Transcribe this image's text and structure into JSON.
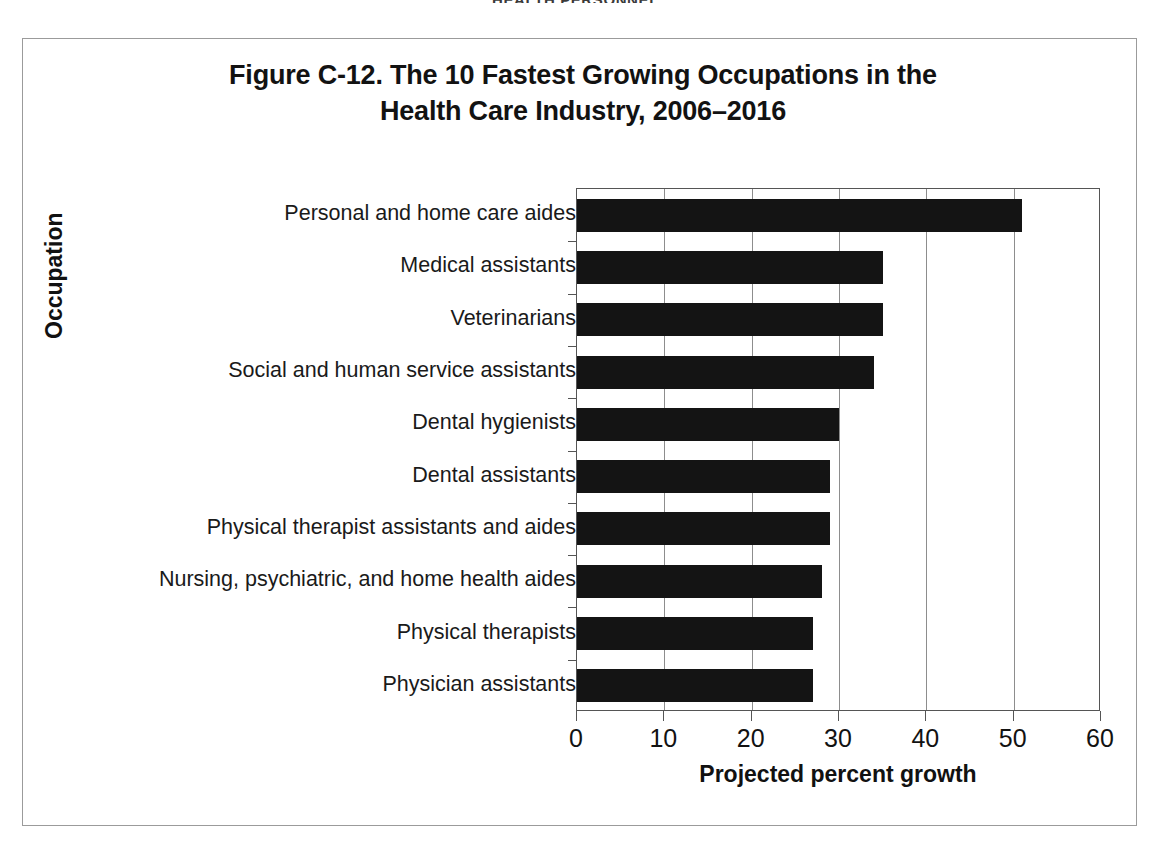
{
  "running_head": "HEALTH PERSONNEL",
  "figure": {
    "title_line1": "Figure C-12. The 10 Fastest Growing Occupations in the",
    "title_line2": "Health Care Industry, 2006–2016"
  },
  "chart_data": {
    "type": "bar",
    "orientation": "horizontal",
    "title": "Figure C-12. The 10 Fastest Growing Occupations in the Health Care Industry, 2006–2016",
    "xlabel": "Projected percent growth",
    "ylabel": "Occupation",
    "xlim": [
      0,
      60
    ],
    "xticks": [
      0,
      10,
      20,
      30,
      40,
      50,
      60
    ],
    "xtick_labels": [
      "0",
      "10",
      "20",
      "30",
      "40",
      "50",
      "60"
    ],
    "grid": "vertical",
    "legend": "none",
    "bar_color": "#141414",
    "categories": [
      "Personal and home care aides",
      "Medical assistants",
      "Veterinarians",
      "Social and human service assistants",
      "Dental hygienists",
      "Dental assistants",
      "Physical therapist assistants and aides",
      "Nursing, psychiatric, and home health aides",
      "Physical therapists",
      "Physician assistants"
    ],
    "values": [
      51,
      35,
      35,
      34,
      30,
      29,
      29,
      28,
      27,
      27
    ]
  }
}
